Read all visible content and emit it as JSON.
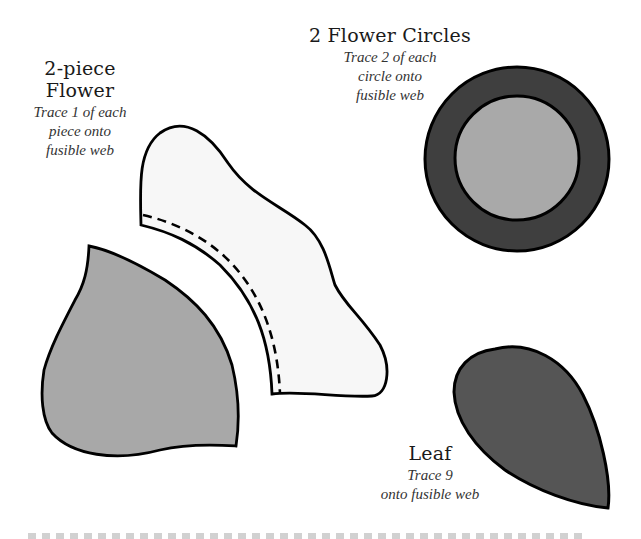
{
  "flower": {
    "title": "2-piece Flower",
    "instructions": [
      "Trace 1 of each",
      "piece onto",
      "fusible web"
    ]
  },
  "circles": {
    "title": "2 Flower Circles",
    "instructions": [
      "Trace 2 of each",
      "circle onto",
      "fusible web"
    ]
  },
  "leaf": {
    "title": "Leaf",
    "instructions": [
      "Trace 9",
      "onto fusible web"
    ]
  },
  "colors": {
    "outline": "#000000",
    "flower_top_fill": "#f7f7f7",
    "flower_bottom_fill": "#a8a8a8",
    "circle_outer_fill": "#3f3f3f",
    "circle_inner_fill": "#a9a9a9",
    "leaf_fill": "#555555"
  }
}
